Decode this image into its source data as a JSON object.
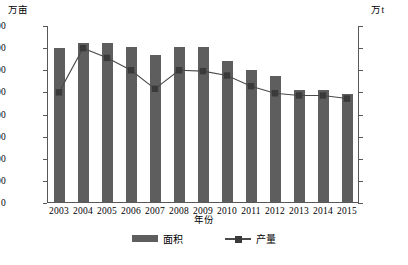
{
  "chart_data": {
    "type": "bar",
    "title": "",
    "xlabel": "年份",
    "categories": [
      "2003",
      "2004",
      "2005",
      "2006",
      "2007",
      "2008",
      "2009",
      "2010",
      "2011",
      "2012",
      "2013",
      "2014",
      "2015"
    ],
    "grid": false,
    "legend_position": "bottom",
    "axes": {
      "left": {
        "unit": "万亩",
        "label": "面积",
        "min": 0,
        "max": 16000,
        "step": 2000,
        "ticks": [
          "0",
          "2 000",
          "4 000",
          "6 000",
          "8 000",
          "10 000",
          "12 000",
          "14 000",
          "16 000"
        ]
      },
      "right": {
        "unit": "万t",
        "label": "产量",
        "min": 0,
        "max": 2000,
        "step": 250,
        "ticks": [
          "0",
          "250",
          "500",
          "750",
          "1 000",
          "1 250",
          "1 500",
          "1 750",
          "2 000"
        ]
      }
    },
    "series": [
      {
        "name": "面积",
        "type": "bar",
        "axis": "left",
        "unit": "万亩",
        "color": "#5e5e5e",
        "values": [
          13950,
          14350,
          14400,
          14050,
          13250,
          14000,
          14050,
          12750,
          11900,
          11350,
          10100,
          10150,
          9800
        ]
      },
      {
        "name": "产量",
        "type": "line",
        "axis": "right",
        "unit": "万t",
        "color": "#4a4a4a",
        "marker": "square",
        "values": [
          1250,
          1750,
          1640,
          1500,
          1290,
          1500,
          1490,
          1440,
          1320,
          1240,
          1215,
          1215,
          1180
        ]
      }
    ]
  },
  "legend": {
    "items": [
      {
        "label": "面积",
        "swatch": "bar-swatch"
      },
      {
        "label": "产量",
        "swatch": "line-marker-swatch"
      }
    ]
  },
  "caption": ""
}
